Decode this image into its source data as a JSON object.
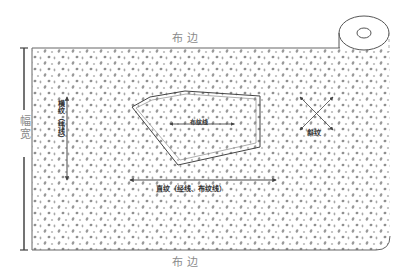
{
  "diagram": {
    "type": "fabric-grain-diagram",
    "labels": {
      "selvage_top": "布边",
      "selvage_bottom": "布边",
      "width": "幅宽",
      "crosswise_grain": "横纹（纬线）",
      "lengthwise_grain": "直纹（经线、布纹线）",
      "bias": "斜纹",
      "piece_grainline": "布纹线"
    },
    "colors": {
      "line": "#555555",
      "label_grey": "#8a8a8a",
      "dots": "#9a9a9a",
      "background": "#ffffff"
    }
  }
}
